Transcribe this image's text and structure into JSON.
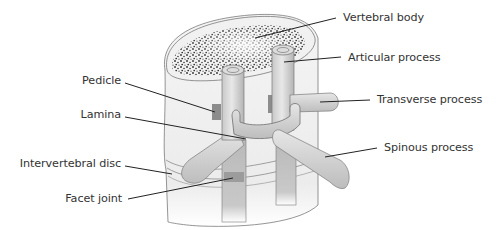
{
  "figure": {
    "colors": {
      "background": "#ffffff",
      "label_text": "#333333",
      "leader_line": "#222222",
      "bone_fill": "#d9d9d9",
      "bone_shadow": "#a8a8a8",
      "outline": "#6e6e6e",
      "body_speckle": "#2b2b2b"
    }
  },
  "labels": {
    "vertebral_body": "Vertebral body",
    "articular_process": "Articular process",
    "transverse_process": "Transverse process",
    "spinous_process": "Spinous process",
    "pedicle": "Pedicle",
    "lamina": "Lamina",
    "intervertebral_disc": "Intervertebral disc",
    "facet_joint": "Facet joint"
  }
}
